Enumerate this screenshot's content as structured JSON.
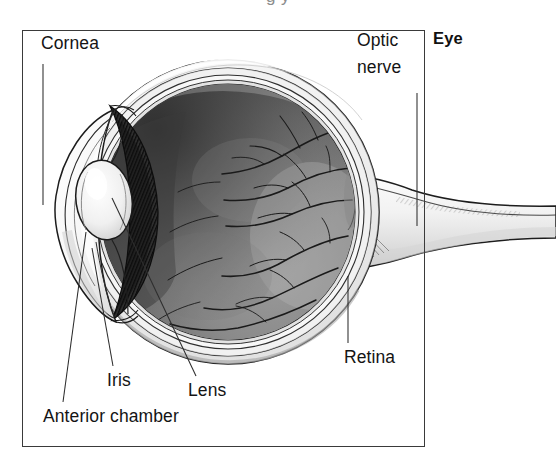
{
  "figure": {
    "title": "Eye",
    "type": "anatomical-cross-section-diagram",
    "orientation": "sagittal cross-section, cornea at left, optic nerve exiting right",
    "top_clipped_text": "g              y",
    "background_color": "#ffffff",
    "border_color": "#3a3a3a",
    "ink_color": "#141414"
  },
  "labels": {
    "cornea": "Cornea",
    "optic_nerve_line1": "Optic",
    "optic_nerve_line2": "nerve",
    "retina": "Retina",
    "iris": "Iris",
    "lens": "Lens",
    "anterior_chamber": "Anterior chamber"
  },
  "structures": [
    {
      "name": "cornea",
      "label": "Cornea",
      "description": "transparent domed front surface, drawn as white bulging lens-shaped outline at the far left of the globe",
      "leader": {
        "from_x": 43,
        "from_y": 64,
        "to_x": 43,
        "to_y": 205,
        "style": "vertical thin line"
      }
    },
    {
      "name": "anterior-chamber",
      "label": "Anterior chamber",
      "description": "pale space between cornea and iris/lens",
      "leader": {
        "from_x": 63,
        "from_y": 402,
        "to_x": 86,
        "to_y": 232,
        "style": "diagonal thin line"
      }
    },
    {
      "name": "iris",
      "label": "Iris",
      "description": "dark radially-striated diaphragm ringing the pupil",
      "leader": {
        "from_x": 113,
        "from_y": 366,
        "to_x": 92,
        "to_y": 248,
        "style": "diagonal thin line"
      }
    },
    {
      "name": "lens",
      "label": "Lens",
      "description": "ovoid biconvex body just behind the pupil",
      "leader": {
        "from_x": 196,
        "from_y": 376,
        "to_x": 113,
        "to_y": 200,
        "style": "long diagonal thin line"
      }
    },
    {
      "name": "retina",
      "label": "Retina",
      "description": "inner light-sensitive lining of the posterior globe carrying branching blood vessels",
      "leader": {
        "from_x": 348,
        "from_y": 343,
        "to_x": 348,
        "to_y": 276,
        "style": "vertical thin line"
      }
    },
    {
      "name": "optic-nerve",
      "label": "Optic nerve",
      "description": "pale trumpet-shaped nerve trunk leaving the back of the globe and widening to the right, extending past the frame border",
      "leader": {
        "from_x": 417,
        "from_y": 93,
        "to_x": 417,
        "to_y": 226,
        "style": "vertical thin line"
      }
    },
    {
      "name": "sclera-choroid-layers",
      "label": "",
      "description": "three to four concentric thin outline bands forming the outer coats of the globe"
    },
    {
      "name": "vitreous-chamber",
      "label": "",
      "description": "large shaded grey interior sphere of the globe, darker toward the upper left"
    },
    {
      "name": "retinal-vessels",
      "label": "",
      "description": "fine dark branching vessels radiating leftward and outward from the optic disc at the right of the globe interior"
    }
  ]
}
